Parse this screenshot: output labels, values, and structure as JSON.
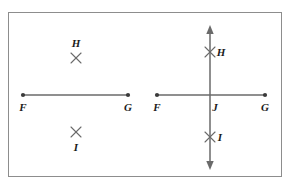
{
  "figure": {
    "background_color": "#ffffff",
    "frame_color": "#8d8d8d",
    "ink_color": "#5a5a5a",
    "label_color": "#1b1b1b"
  },
  "panels": [
    {
      "id": "left-panel",
      "name": "segment-with-marked-points",
      "segment": {
        "name": "segment-fg",
        "x1": 23,
        "y1": 95,
        "x2": 128,
        "y2": 95
      },
      "endpoints": [
        {
          "name": "point-f",
          "label": "F",
          "cx": 23,
          "cy": 95,
          "label_x": 23,
          "label_y": 107
        },
        {
          "name": "point-g",
          "label": "G",
          "cx": 128,
          "cy": 95,
          "label_x": 128,
          "label_y": 107
        }
      ],
      "marks": [
        {
          "name": "mark-h",
          "label": "H",
          "x": 76,
          "y": 58,
          "label_x": 76,
          "label_y": 43
        },
        {
          "name": "mark-i",
          "label": "I",
          "x": 76,
          "y": 132,
          "label_x": 76,
          "label_y": 147
        }
      ]
    },
    {
      "id": "right-panel",
      "name": "segment-with-perpendicular-line",
      "segment": {
        "name": "segment-fg",
        "x1": 157,
        "y1": 95,
        "x2": 265,
        "y2": 95
      },
      "endpoints": [
        {
          "name": "point-f",
          "label": "F",
          "cx": 157,
          "cy": 95,
          "label_x": 157,
          "label_y": 107
        },
        {
          "name": "point-g",
          "label": "G",
          "cx": 265,
          "cy": 95,
          "label_x": 265,
          "label_y": 107
        }
      ],
      "vertical_line": {
        "name": "line-hi",
        "x": 210,
        "y_top": 27,
        "y_bottom": 168,
        "arrow_top": true,
        "arrow_bottom": true
      },
      "marks": [
        {
          "name": "mark-h",
          "label": "H",
          "x": 210,
          "y": 52,
          "label_x": 221,
          "label_y": 52
        },
        {
          "name": "mark-i",
          "label": "I",
          "x": 210,
          "y": 137,
          "label_x": 220,
          "label_y": 137
        }
      ],
      "intersection": {
        "name": "point-j",
        "label": "J",
        "cx": 210,
        "cy": 95,
        "label_x": 215,
        "label_y": 107
      }
    }
  ],
  "labels": {
    "f": "F",
    "g": "G",
    "h": "H",
    "i": "I",
    "j": "J"
  }
}
